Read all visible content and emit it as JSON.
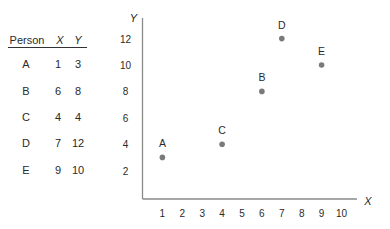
{
  "table": {
    "headers": [
      "Person",
      "X",
      "Y"
    ],
    "rows": [
      [
        "A",
        "1",
        "3"
      ],
      [
        "B",
        "6",
        "8"
      ],
      [
        "C",
        "4",
        "4"
      ],
      [
        "D",
        "7",
        "12"
      ],
      [
        "E",
        "9",
        "10"
      ]
    ]
  },
  "chart_data": {
    "type": "scatter",
    "title": "",
    "xlabel": "X",
    "ylabel": "Y",
    "xlim": [
      0,
      10.8
    ],
    "ylim": [
      0,
      13
    ],
    "xticks": [
      1,
      2,
      3,
      4,
      5,
      6,
      7,
      8,
      9,
      10
    ],
    "yticks": [
      2,
      4,
      6,
      8,
      10,
      12
    ],
    "grid": false,
    "legend": null,
    "points": [
      {
        "label": "A",
        "x": 1,
        "y": 3
      },
      {
        "label": "B",
        "x": 6,
        "y": 8
      },
      {
        "label": "C",
        "x": 4,
        "y": 4
      },
      {
        "label": "D",
        "x": 7,
        "y": 12
      },
      {
        "label": "E",
        "x": 9,
        "y": 10
      }
    ],
    "colors": {
      "axis": "#8a8a8a",
      "point": "#7a7a7a",
      "text": "#2a2a2a"
    }
  }
}
